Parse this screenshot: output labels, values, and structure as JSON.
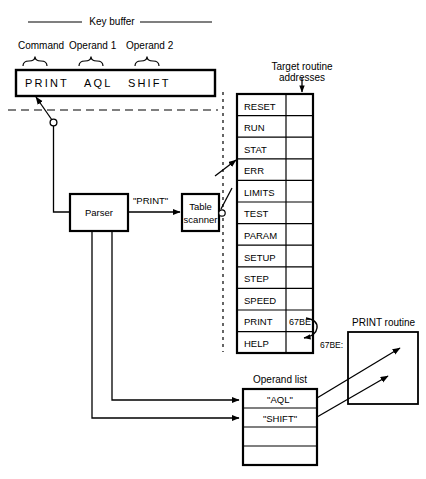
{
  "diagram": {
    "title": "Key buffer",
    "buffer": {
      "name": "key-buffer",
      "headers": [
        "Command",
        "Operand 1",
        "Operand 2"
      ],
      "text": "PRINT   AQL   SHIFT",
      "fields": [
        "PRINT",
        "AQL",
        "SHIFT"
      ]
    },
    "blocks": {
      "parser": "Parser",
      "table_scanner_line1": "Table",
      "table_scanner_line2": "scanner",
      "print_routine": "PRINT routine"
    },
    "edge_labels": {
      "parsed_command": "\"PRINT\"",
      "address_ref": "67BE:"
    },
    "command_table": {
      "column_label_line1": "Target routine",
      "column_label_line2": "addresses",
      "rows": [
        {
          "command": "RESET",
          "address": ""
        },
        {
          "command": "RUN",
          "address": ""
        },
        {
          "command": "STAT",
          "address": ""
        },
        {
          "command": "ERR",
          "address": ""
        },
        {
          "command": "LIMITS",
          "address": ""
        },
        {
          "command": "TEST",
          "address": ""
        },
        {
          "command": "PARAM",
          "address": ""
        },
        {
          "command": "SETUP",
          "address": ""
        },
        {
          "command": "STEP",
          "address": ""
        },
        {
          "command": "SPEED",
          "address": ""
        },
        {
          "command": "PRINT",
          "address": "67BE"
        },
        {
          "command": "HELP",
          "address": ""
        }
      ]
    },
    "operand_list": {
      "title": "Operand list",
      "rows": [
        "\"AQL\"",
        "\"SHIFT\"",
        "",
        ""
      ]
    }
  }
}
